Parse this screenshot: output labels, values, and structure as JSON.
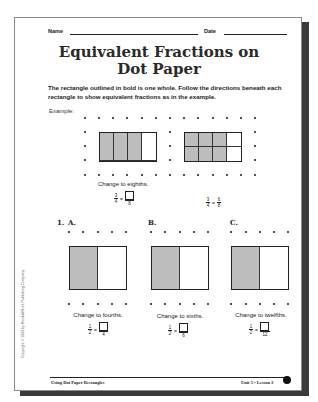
{
  "header": {
    "name_label": "Name",
    "date_label": "Date"
  },
  "title": {
    "line1": "Equivalent Fractions on",
    "line2": "Dot Paper"
  },
  "directions": "The rectangle outlined in bold is one whole. Follow the directions beneath each rectangle to show equivalent fractions as in the example.",
  "example": {
    "label": "Example:",
    "caption": "Change to eighths.",
    "rect1": {
      "cols": 4,
      "rows": 1,
      "shaded": 3
    },
    "rect2": {
      "cols": 4,
      "rows": 2,
      "shaded_cells": [
        0,
        1,
        2,
        4,
        5,
        6
      ]
    },
    "fraction_left": {
      "num": "3",
      "den": "4",
      "answer_den": "8"
    },
    "fraction_right": {
      "num": "3",
      "den": "4",
      "ans_num": "6",
      "ans_den": "8"
    }
  },
  "problem": {
    "number": "1.",
    "items": [
      {
        "label": "A.",
        "caption": "Change to fourths.",
        "num": "1",
        "den": "2",
        "answer_den": "4"
      },
      {
        "label": "B.",
        "caption": "Change to sixths.",
        "num": "1",
        "den": "2",
        "answer_den": "6"
      },
      {
        "label": "C.",
        "caption": "Change to twelfths.",
        "num": "1",
        "den": "2",
        "answer_den": "12"
      }
    ]
  },
  "copyright": "Copyright © 1993 by Kendall/Hunt Publishing Company",
  "footer": {
    "left": "Using Dot Paper Rectangles",
    "right": "Unit 5 • Lesson 3"
  }
}
